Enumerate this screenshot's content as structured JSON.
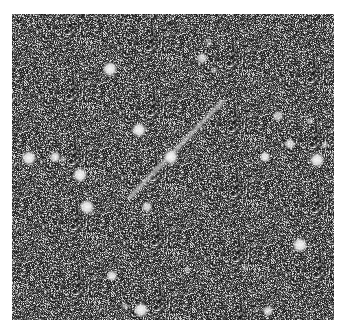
{
  "image": {
    "description": "Grayscale astronomical star field with a diagonal trail (streak)",
    "background_color": "#3a3a3a",
    "star_color": "#f4f4f4",
    "streak_color": "#d8d8d8"
  },
  "stars": [
    {
      "name": "star",
      "x": 98,
      "y": 55,
      "brightness": 0.95,
      "size": "large"
    },
    {
      "name": "star",
      "x": 127,
      "y": 116,
      "brightness": 0.95,
      "size": "large"
    },
    {
      "name": "star",
      "x": 159,
      "y": 143,
      "brightness": 0.95,
      "size": "large"
    },
    {
      "name": "star",
      "x": 17,
      "y": 144,
      "brightness": 0.95,
      "size": "large"
    },
    {
      "name": "star",
      "x": 43,
      "y": 143,
      "brightness": 0.9,
      "size": "medium"
    },
    {
      "name": "star",
      "x": 51,
      "y": 145,
      "brightness": 0.5,
      "size": "small"
    },
    {
      "name": "star",
      "x": 68,
      "y": 161,
      "brightness": 0.95,
      "size": "large"
    },
    {
      "name": "star",
      "x": 75,
      "y": 193,
      "brightness": 0.95,
      "size": "large"
    },
    {
      "name": "star",
      "x": 135,
      "y": 193,
      "brightness": 0.8,
      "size": "medium"
    },
    {
      "name": "star",
      "x": 190,
      "y": 44,
      "brightness": 0.8,
      "size": "medium"
    },
    {
      "name": "star",
      "x": 197,
      "y": 29,
      "brightness": 0.5,
      "size": "small"
    },
    {
      "name": "star",
      "x": 202,
      "y": 56,
      "brightness": 0.55,
      "size": "small"
    },
    {
      "name": "star",
      "x": 266,
      "y": 102,
      "brightness": 0.75,
      "size": "medium"
    },
    {
      "name": "star",
      "x": 298,
      "y": 107,
      "brightness": 0.6,
      "size": "small"
    },
    {
      "name": "star",
      "x": 278,
      "y": 130,
      "brightness": 0.8,
      "size": "medium"
    },
    {
      "name": "star",
      "x": 313,
      "y": 131,
      "brightness": 0.6,
      "size": "small"
    },
    {
      "name": "star",
      "x": 253,
      "y": 143,
      "brightness": 0.9,
      "size": "medium"
    },
    {
      "name": "star",
      "x": 305,
      "y": 146,
      "brightness": 0.95,
      "size": "large"
    },
    {
      "name": "star",
      "x": 288,
      "y": 231,
      "brightness": 0.95,
      "size": "large"
    },
    {
      "name": "star",
      "x": 100,
      "y": 262,
      "brightness": 0.9,
      "size": "medium"
    },
    {
      "name": "star",
      "x": 129,
      "y": 296,
      "brightness": 0.95,
      "size": "large"
    },
    {
      "name": "star",
      "x": 113,
      "y": 292,
      "brightness": 0.5,
      "size": "small"
    },
    {
      "name": "star",
      "x": 175,
      "y": 256,
      "brightness": 0.5,
      "size": "small"
    },
    {
      "name": "star",
      "x": 256,
      "y": 297,
      "brightness": 0.8,
      "size": "medium"
    },
    {
      "name": "star",
      "x": 233,
      "y": 254,
      "brightness": 0.4,
      "size": "small"
    }
  ],
  "streak": {
    "x1": 118,
    "y1": 183,
    "x2": 210,
    "y2": 88
  }
}
